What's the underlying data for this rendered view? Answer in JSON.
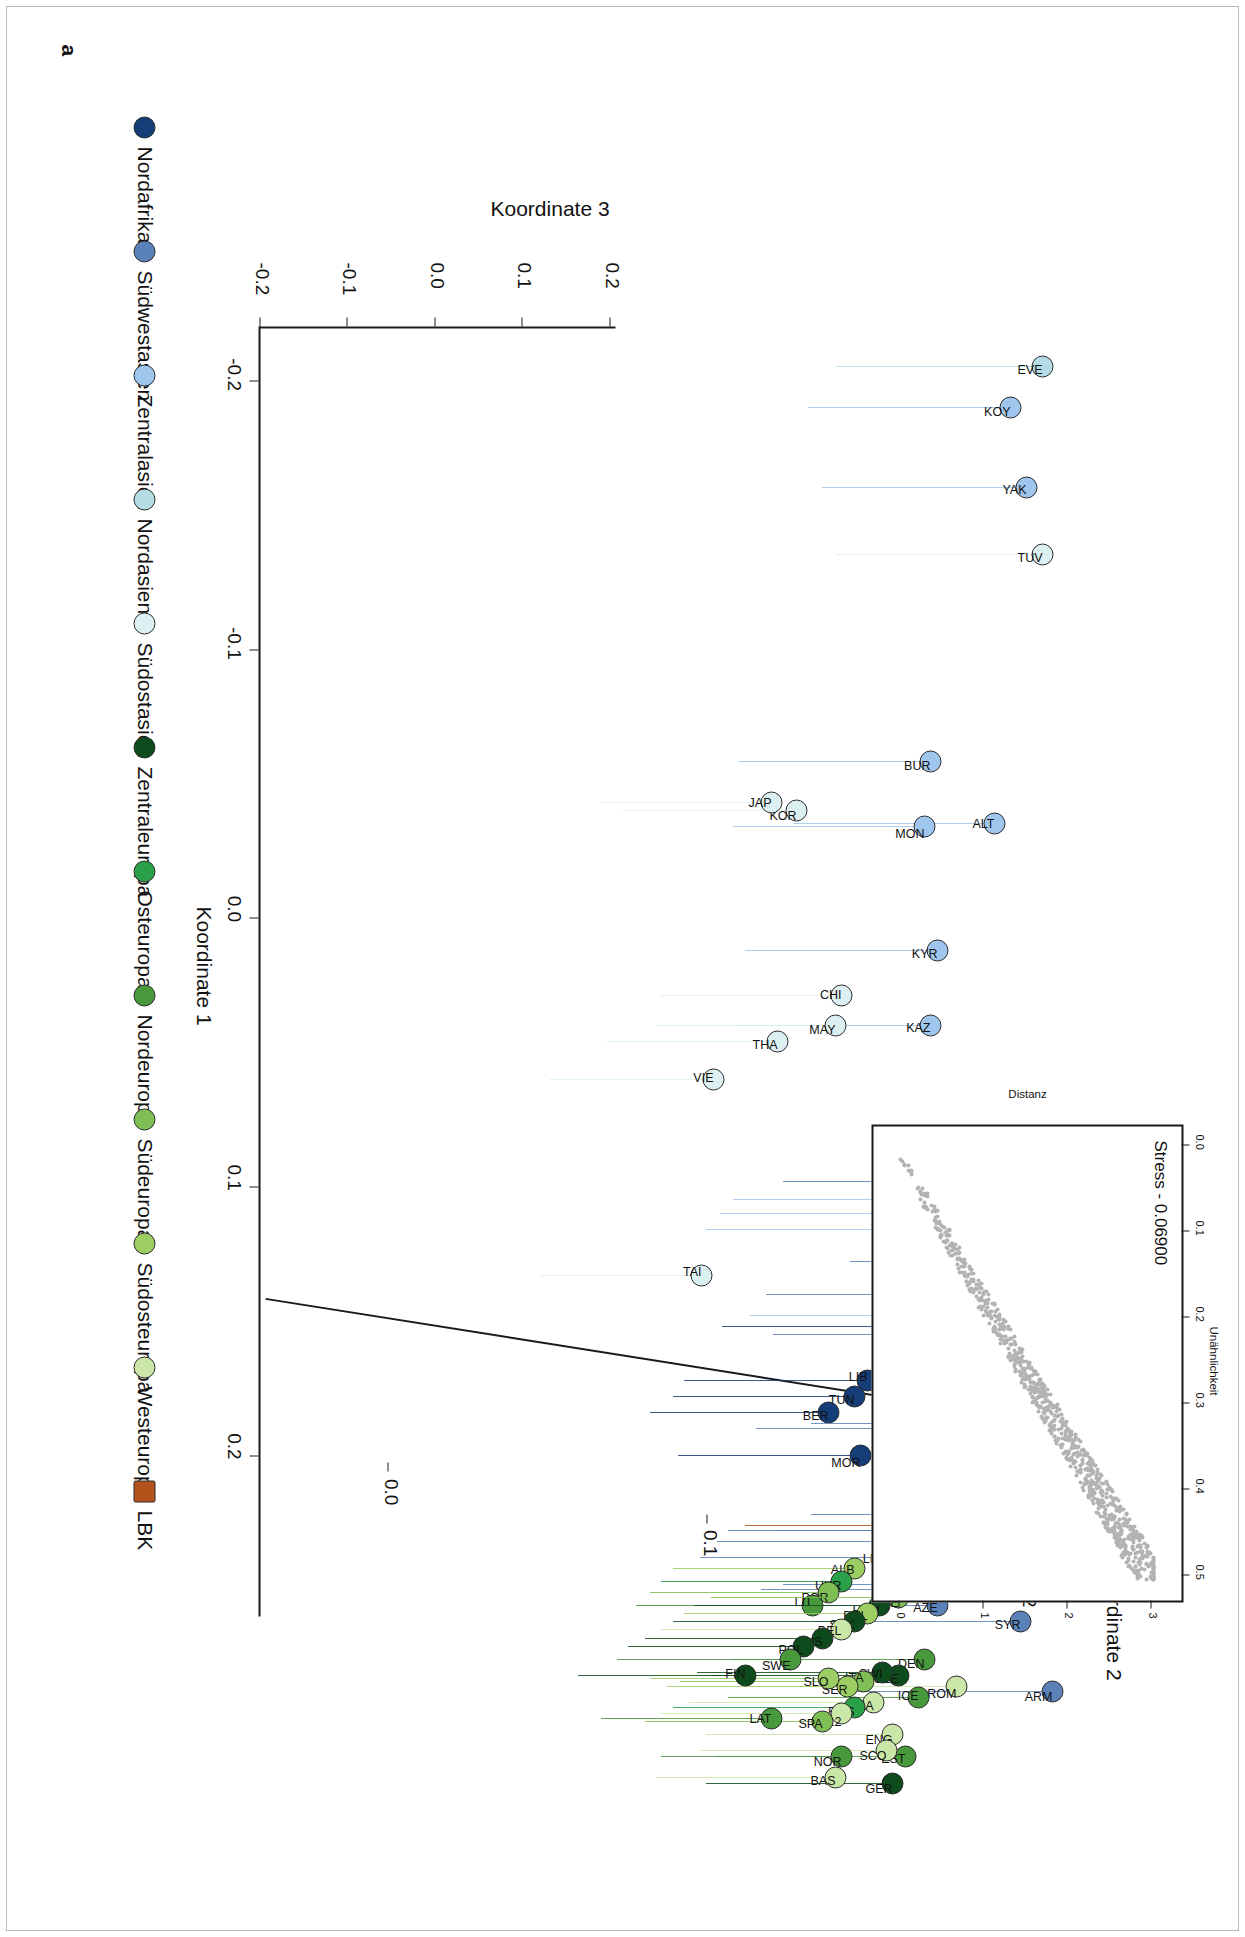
{
  "panel": {
    "label": "a"
  },
  "axes": {
    "x": {
      "title": "Koordinate 1",
      "ticks": [
        "-0.2",
        "-0.1",
        "0.0",
        "0.1",
        "0.2"
      ],
      "values": [
        -0.2,
        -0.1,
        0.0,
        0.1,
        0.2
      ]
    },
    "y": {
      "title": "Koordinate 2",
      "ticks": [
        "0.0",
        "0.1",
        "0.2"
      ],
      "values": [
        0.0,
        0.1,
        0.2
      ]
    },
    "z": {
      "title": "Koordinate 3",
      "ticks": [
        "-0.2",
        "-0.1",
        "0.0",
        "0.1",
        "0.2"
      ],
      "values": [
        -0.2,
        -0.1,
        0.0,
        0.1,
        0.2
      ]
    }
  },
  "inset": {
    "stress_label": "Stress - 0.06900",
    "xlabel": "Unähnlichkeit",
    "ylabel": "Distanz",
    "xticks": [
      "0.0",
      "0.1",
      "0.2",
      "0.3",
      "0.4",
      "0.5"
    ],
    "yticks": [
      "0",
      "1",
      "2",
      "3"
    ]
  },
  "legend": {
    "items": [
      {
        "label": "Nordafrika",
        "color": "#153d78",
        "shape": "circle"
      },
      {
        "label": "Südwestasien",
        "color": "#5b82b8",
        "shape": "circle"
      },
      {
        "label": "Zentralasien",
        "color": "#9fc7ee",
        "shape": "circle"
      },
      {
        "label": "Nordasien",
        "color": "#b4dce4",
        "shape": "circle"
      },
      {
        "label": "Südostasien",
        "color": "#dcf0f2",
        "shape": "circle"
      },
      {
        "label": "Zentraleuropa",
        "color": "#0d4a1c",
        "shape": "circle"
      },
      {
        "label": "Osteuropa",
        "color": "#2aa148",
        "shape": "circle"
      },
      {
        "label": "Nordeuropa",
        "color": "#47993c",
        "shape": "circle"
      },
      {
        "label": "Südeuropa",
        "color": "#7ebe54",
        "shape": "circle"
      },
      {
        "label": "Südosteuropa",
        "color": "#9dce63",
        "shape": "circle"
      },
      {
        "label": "Westeuropa",
        "color": "#cbe7a8",
        "shape": "circle"
      },
      {
        "label": "LBK",
        "color": "#b4521c",
        "shape": "square"
      }
    ]
  },
  "chart_data": {
    "type": "scatter",
    "title": "",
    "xlabel": "Koordinate 1",
    "ylabel": "Koordinate 2",
    "zlabel": "Koordinate 3",
    "xlim": [
      -0.22,
      0.26
    ],
    "ylim": [
      -0.04,
      0.22
    ],
    "zlim": [
      -0.22,
      0.24
    ],
    "grid": false,
    "legend_position": "bottom-left",
    "note": "3D MDS ordination rendered as a perspective scatter with vertical drop lines; inset is a Shepard stress diagram.",
    "points": [
      {
        "label": "EVE",
        "group": "Nordasien",
        "color": "#b4dce4",
        "x": -0.205,
        "y": 0.205,
        "z": 0.03
      },
      {
        "label": "KOY",
        "group": "Zentralasien",
        "color": "#9fc7ee",
        "x": -0.19,
        "y": 0.195,
        "z": 0.025
      },
      {
        "label": "YAK",
        "group": "Zentralasien",
        "color": "#9fc7ee",
        "x": -0.16,
        "y": 0.2,
        "z": 0.02
      },
      {
        "label": "TUV",
        "group": "Südostasien",
        "color": "#dcf0f2",
        "x": -0.135,
        "y": 0.205,
        "z": 0.018
      },
      {
        "label": "BUR",
        "group": "Zentralasien",
        "color": "#9fc7ee",
        "x": -0.058,
        "y": 0.17,
        "z": 0.01
      },
      {
        "label": "ALT",
        "group": "Zentralasien",
        "color": "#9fc7ee",
        "x": -0.035,
        "y": 0.19,
        "z": 0.012
      },
      {
        "label": "MON",
        "group": "Zentralasien",
        "color": "#9fc7ee",
        "x": -0.034,
        "y": 0.168,
        "z": 0.008
      },
      {
        "label": "KOR",
        "group": "Südostasien",
        "color": "#dcf0f2",
        "x": -0.04,
        "y": 0.128,
        "z": 0.004
      },
      {
        "label": "JAP",
        "group": "Südostasien",
        "color": "#dcf0f2",
        "x": -0.043,
        "y": 0.12,
        "z": 0.004
      },
      {
        "label": "KYR",
        "group": "Zentralasien",
        "color": "#9fc7ee",
        "x": 0.012,
        "y": 0.172,
        "z": 0.008
      },
      {
        "label": "CHI",
        "group": "Südostasien",
        "color": "#dcf0f2",
        "x": 0.029,
        "y": 0.142,
        "z": 0.004
      },
      {
        "label": "KAZ",
        "group": "Zentralasien",
        "color": "#9fc7ee",
        "x": 0.04,
        "y": 0.17,
        "z": 0.008
      },
      {
        "label": "MAY",
        "group": "Südostasien",
        "color": "#dcf0f2",
        "x": 0.04,
        "y": 0.14,
        "z": 0.003
      },
      {
        "label": "THA",
        "group": "Südostasien",
        "color": "#dcf0f2",
        "x": 0.046,
        "y": 0.122,
        "z": 0.003
      },
      {
        "label": "VIE",
        "group": "Südostasien",
        "color": "#dcf0f2",
        "x": 0.06,
        "y": 0.102,
        "z": 0.002
      },
      {
        "label": "YEM",
        "group": "Südwestasien",
        "color": "#5b82b8",
        "x": 0.098,
        "y": 0.186,
        "z": 0.014
      },
      {
        "label": "UZB",
        "group": "Zentralasien",
        "color": "#9fc7ee",
        "x": 0.105,
        "y": 0.168,
        "z": 0.009
      },
      {
        "label": "TUK",
        "group": "Zentralasien",
        "color": "#9fc7ee",
        "x": 0.11,
        "y": 0.163,
        "z": 0.009
      },
      {
        "label": "TAJ",
        "group": "Zentralasien",
        "color": "#9fc7ee",
        "x": 0.116,
        "y": 0.158,
        "z": 0.008
      },
      {
        "label": "SAU",
        "group": "Südwestasien",
        "color": "#5b82b8",
        "x": 0.128,
        "y": 0.21,
        "z": 0.016
      },
      {
        "label": "TAI",
        "group": "Südostasien",
        "color": "#dcf0f2",
        "x": 0.133,
        "y": 0.098,
        "z": 0.002
      },
      {
        "label": "UAE",
        "group": "Südwestasien",
        "color": "#5b82b8",
        "x": 0.14,
        "y": 0.18,
        "z": 0.012
      },
      {
        "label": "KHA",
        "group": "Zentralasien",
        "color": "#9fc7ee",
        "x": 0.148,
        "y": 0.174,
        "z": 0.01
      },
      {
        "label": "KUW",
        "group": "Südwestasien",
        "color": "#5b82b8",
        "x": 0.155,
        "y": 0.182,
        "z": 0.012
      },
      {
        "label": "EGY",
        "group": "Nordafrika",
        "color": "#153d78",
        "x": 0.152,
        "y": 0.164,
        "z": 0.02
      },
      {
        "label": "LIB",
        "group": "Nordafrika",
        "color": "#153d78",
        "x": 0.172,
        "y": 0.15,
        "z": 0.022
      },
      {
        "label": "TUN",
        "group": "Nordafrika",
        "color": "#153d78",
        "x": 0.178,
        "y": 0.146,
        "z": 0.022
      },
      {
        "label": "BER",
        "group": "Nordafrika",
        "color": "#153d78",
        "x": 0.184,
        "y": 0.138,
        "z": 0.024
      },
      {
        "label": "DRZ",
        "group": "Südwestasien",
        "color": "#5b82b8",
        "x": 0.188,
        "y": 0.196,
        "z": 0.014
      },
      {
        "label": "JOR",
        "group": "Südwestasien",
        "color": "#5b82b8",
        "x": 0.19,
        "y": 0.176,
        "z": 0.013
      },
      {
        "label": "MOR",
        "group": "Nordafrika",
        "color": "#153d78",
        "x": 0.2,
        "y": 0.148,
        "z": 0.026
      },
      {
        "label": "OSS",
        "group": "Südwestasien",
        "color": "#5b82b8",
        "x": 0.222,
        "y": 0.196,
        "z": 0.015
      },
      {
        "label": "IRQ",
        "group": "Südwestasien",
        "color": "#5b82b8",
        "x": 0.228,
        "y": 0.183,
        "z": 0.013
      },
      {
        "label": "LBK",
        "group": "LBK",
        "color": "#b4521c",
        "x": 0.226,
        "y": 0.172,
        "z": 0.03
      },
      {
        "label": "IRA",
        "group": "Südwestasien",
        "color": "#5b82b8",
        "x": 0.228,
        "y": 0.166,
        "z": 0.012
      },
      {
        "label": "PAL",
        "group": "Südwestasien",
        "color": "#5b82b8",
        "x": 0.232,
        "y": 0.162,
        "z": 0.012
      },
      {
        "label": "LEB",
        "group": "Südwestasien",
        "color": "#5b82b8",
        "x": 0.238,
        "y": 0.156,
        "z": 0.012
      },
      {
        "label": "GEO",
        "group": "Südwestasien",
        "color": "#5b82b8",
        "x": 0.248,
        "y": 0.186,
        "z": 0.014
      },
      {
        "label": "TUR",
        "group": "Südwestasien",
        "color": "#5b82b8",
        "x": 0.25,
        "y": 0.178,
        "z": 0.013
      },
      {
        "label": "AZE",
        "group": "Südwestasien",
        "color": "#5b82b8",
        "x": 0.256,
        "y": 0.172,
        "z": 0.013
      },
      {
        "label": "SYR",
        "group": "Südwestasien",
        "color": "#5b82b8",
        "x": 0.262,
        "y": 0.198,
        "z": 0.015
      },
      {
        "label": "ARM",
        "group": "Südwestasien",
        "color": "#5b82b8",
        "x": 0.288,
        "y": 0.208,
        "z": 0.016
      },
      {
        "label": "ROM",
        "group": "Westeuropa",
        "color": "#cbe7a8",
        "x": 0.286,
        "y": 0.178,
        "z": 0.01
      },
      {
        "label": "ALB",
        "group": "Südosteuropa",
        "color": "#9dce63",
        "x": 0.242,
        "y": 0.146,
        "z": 0.006
      },
      {
        "label": "UKR",
        "group": "Osteuropa",
        "color": "#2aa148",
        "x": 0.247,
        "y": 0.142,
        "z": 0.006
      },
      {
        "label": "POR",
        "group": "Südeuropa",
        "color": "#7ebe54",
        "x": 0.251,
        "y": 0.138,
        "z": 0.006
      },
      {
        "label": "LIT",
        "group": "Nordeuropa",
        "color": "#47993c",
        "x": 0.256,
        "y": 0.133,
        "z": 0.006
      },
      {
        "label": "GRE",
        "group": "Südeuropa",
        "color": "#7ebe54",
        "x": 0.253,
        "y": 0.16,
        "z": 0.007
      },
      {
        "label": "HUN",
        "group": "Zentraleuropa",
        "color": "#0d4a1c",
        "x": 0.256,
        "y": 0.154,
        "z": 0.008
      },
      {
        "label": "BUL",
        "group": "Südosteuropa",
        "color": "#9dce63",
        "x": 0.259,
        "y": 0.15,
        "z": 0.006
      },
      {
        "label": "SVK",
        "group": "Zentraleuropa",
        "color": "#0d4a1c",
        "x": 0.262,
        "y": 0.146,
        "z": 0.007
      },
      {
        "label": "BEL",
        "group": "Westeuropa",
        "color": "#cbe7a8",
        "x": 0.265,
        "y": 0.142,
        "z": 0.005
      },
      {
        "label": "AUS",
        "group": "Zentraleuropa",
        "color": "#0d4a1c",
        "x": 0.268,
        "y": 0.136,
        "z": 0.007
      },
      {
        "label": "POL",
        "group": "Zentraleuropa",
        "color": "#0d4a1c",
        "x": 0.271,
        "y": 0.13,
        "z": 0.007
      },
      {
        "label": "DEN",
        "group": "Nordeuropa",
        "color": "#47993c",
        "x": 0.276,
        "y": 0.168,
        "z": 0.007
      },
      {
        "label": "CZE",
        "group": "Zentraleuropa",
        "color": "#0d4a1c",
        "x": 0.282,
        "y": 0.16,
        "z": 0.008
      },
      {
        "label": "SWI",
        "group": "Zentraleuropa",
        "color": "#0d4a1c",
        "x": 0.281,
        "y": 0.155,
        "z": 0.008
      },
      {
        "label": "ITA",
        "group": "Südeuropa",
        "color": "#7ebe54",
        "x": 0.284,
        "y": 0.149,
        "z": 0.006
      },
      {
        "label": "SER",
        "group": "Südosteuropa",
        "color": "#9dce63",
        "x": 0.286,
        "y": 0.144,
        "z": 0.006
      },
      {
        "label": "SLO",
        "group": "Südosteuropa",
        "color": "#9dce63",
        "x": 0.283,
        "y": 0.138,
        "z": 0.006
      },
      {
        "label": "SWE",
        "group": "Nordeuropa",
        "color": "#47993c",
        "x": 0.276,
        "y": 0.126,
        "z": 0.006
      },
      {
        "label": "FIN",
        "group": "Zentraleuropa",
        "color": "#0d4a1c",
        "x": 0.282,
        "y": 0.112,
        "z": 0.007
      },
      {
        "label": "ICE",
        "group": "Nordeuropa",
        "color": "#47993c",
        "x": 0.29,
        "y": 0.166,
        "z": 0.007
      },
      {
        "label": "FRA",
        "group": "Westeuropa",
        "color": "#cbe7a8",
        "x": 0.292,
        "y": 0.152,
        "z": 0.005
      },
      {
        "label": "RUS",
        "group": "Osteuropa",
        "color": "#2aa148",
        "x": 0.294,
        "y": 0.146,
        "z": 0.006
      },
      {
        "label": "BEL2",
        "group": "Westeuropa",
        "color": "#cbe7a8",
        "x": 0.296,
        "y": 0.142,
        "z": 0.005
      },
      {
        "label": "SPA",
        "group": "Südeuropa",
        "color": "#7ebe54",
        "x": 0.299,
        "y": 0.136,
        "z": 0.006
      },
      {
        "label": "LAT",
        "group": "Nordeuropa",
        "color": "#47993c",
        "x": 0.298,
        "y": 0.12,
        "z": 0.006
      },
      {
        "label": "ENG",
        "group": "Westeuropa",
        "color": "#cbe7a8",
        "x": 0.304,
        "y": 0.158,
        "z": 0.005
      },
      {
        "label": "EST",
        "group": "Nordeuropa",
        "color": "#47993c",
        "x": 0.312,
        "y": 0.162,
        "z": 0.006
      },
      {
        "label": "SCO",
        "group": "Westeuropa",
        "color": "#cbe7a8",
        "x": 0.31,
        "y": 0.156,
        "z": 0.005
      },
      {
        "label": "NOR",
        "group": "Nordeuropa",
        "color": "#47993c",
        "x": 0.312,
        "y": 0.142,
        "z": 0.006
      },
      {
        "label": "GER",
        "group": "Zentraleuropa",
        "color": "#0d4a1c",
        "x": 0.322,
        "y": 0.158,
        "z": 0.008
      },
      {
        "label": "BAS",
        "group": "Westeuropa",
        "color": "#cbe7a8",
        "x": 0.32,
        "y": 0.14,
        "z": 0.005
      }
    ]
  }
}
